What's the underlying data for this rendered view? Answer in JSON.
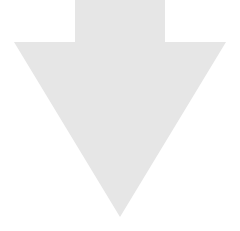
{
  "icon": {
    "name": "arrow-down-icon",
    "fill_color": "#e6e6e6",
    "background_color": "#ffffff"
  }
}
